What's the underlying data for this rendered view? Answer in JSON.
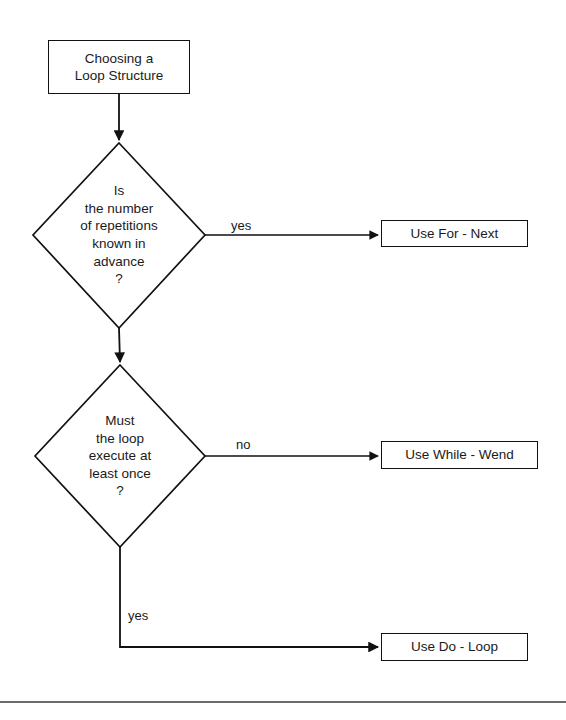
{
  "diagram": {
    "title": "Choosing a Loop Structure",
    "type": "flowchart",
    "nodes": {
      "start": {
        "shape": "process",
        "label": "Choosing a\nLoop Structure"
      },
      "decision_1": {
        "shape": "decision",
        "label": "Is\nthe number\nof repetitions\nknown in\nadvance\n?"
      },
      "decision_2": {
        "shape": "decision",
        "label": "Must\nthe loop\nexecute at\nleast once\n?"
      },
      "for_next": {
        "shape": "process",
        "label": "Use For - Next"
      },
      "while_wend": {
        "shape": "process",
        "label": "Use While - Wend"
      },
      "do_loop": {
        "shape": "process",
        "label": "Use Do - Loop"
      }
    },
    "edge_labels": {
      "decision_1_yes": "yes",
      "decision_2_no": "no",
      "decision_2_yes": "yes"
    },
    "colors": {
      "stroke": "#111111",
      "text": "#1a1a1a",
      "background": "#ffffff",
      "rule": "#3a3a3a"
    }
  }
}
